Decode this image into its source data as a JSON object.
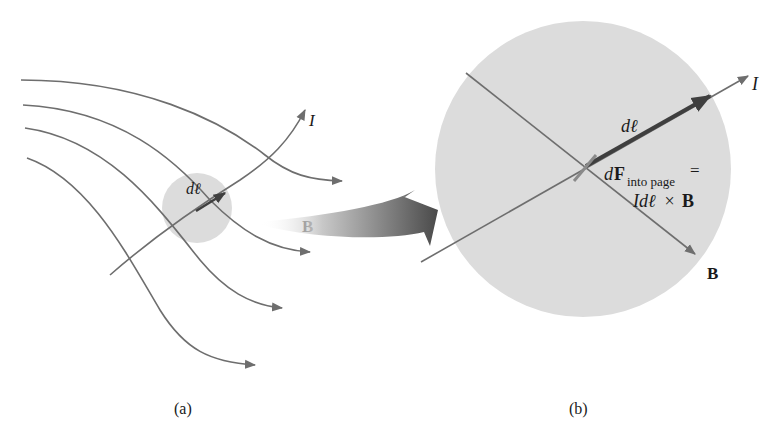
{
  "figure": {
    "panel_a": {
      "caption": "(a)",
      "current_label": "I",
      "element_label": "dℓ",
      "field_label": "B"
    },
    "panel_b": {
      "caption": "(b)",
      "current_label": "I",
      "element_label": "dℓ",
      "field_label": "B",
      "force_label_main": "dF",
      "force_label_sub": "into page",
      "force_label_eq": "=",
      "force_formula_prefix": "Idℓ",
      "force_formula_cross": " × ",
      "force_formula_b": "B"
    },
    "colors": {
      "line": "#6e6e6e",
      "circle_fill": "#dcdcdc",
      "dl_arrow": "#3f3f3f",
      "text": "#1a1a1a"
    }
  }
}
